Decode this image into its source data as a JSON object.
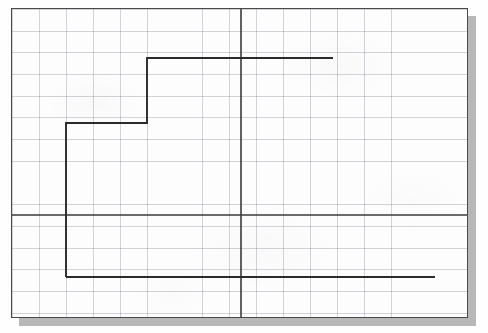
{
  "document": {
    "kind": "scanned-graph-paper",
    "sheet_background": "#fdfdfd",
    "sheet_border_color": "#4a4a4a",
    "shadow_color": "#b7b7b7",
    "grid_line_color": "#6e6e82",
    "axis_color": "#3a3a3a",
    "curve_color": "#2b2b2b"
  },
  "chart_data": {
    "type": "line",
    "title": "",
    "subtitle": "",
    "xlabel": "",
    "ylabel": "",
    "legend": [],
    "annotations": [],
    "grid": true,
    "grid_minor_spacing_x_px": 27.1,
    "grid_minor_spacing_y_px": 21.7,
    "axes": {
      "x_axis_y_px": 206,
      "y_axis_x_px": 229,
      "x_axis_from_px": 0,
      "x_axis_to_px": 455,
      "y_axis_from_px": 0,
      "y_axis_to_px": 308,
      "x_range_grid": [
        -8.45,
        8.35
      ],
      "y_range_grid": [
        -5.15,
        9.12
      ]
    },
    "series": [
      {
        "name": "step-function",
        "shape": "staircase",
        "points_px": [
          [
            54,
            268
          ],
          [
            54,
            114
          ],
          [
            135,
            114
          ],
          [
            135,
            49
          ],
          [
            321,
            49
          ]
        ],
        "points_grid": [
          [
            -6.45,
            -2.85
          ],
          [
            -6.45,
            4.24
          ],
          [
            -3.46,
            4.24
          ],
          [
            -3.46,
            7.24
          ],
          [
            3.4,
            7.24
          ]
        ]
      },
      {
        "name": "lower-horizontal-segment",
        "shape": "horizontal-line",
        "points_px": [
          [
            54,
            268
          ],
          [
            423,
            268
          ]
        ],
        "points_grid": [
          [
            -6.45,
            -2.85
          ],
          [
            7.16,
            -2.85
          ]
        ]
      }
    ]
  }
}
